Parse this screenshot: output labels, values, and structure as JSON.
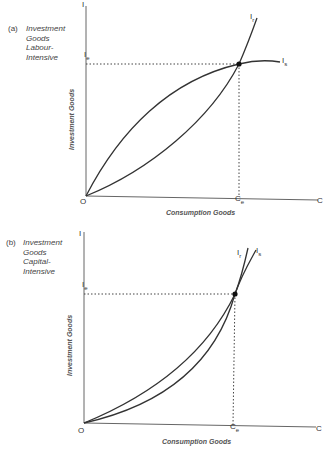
{
  "panels": [
    {
      "id": "a",
      "caption": {
        "tag": "(a)",
        "lines": [
          "Investment",
          "Goods",
          "Labour-",
          "Intensive"
        ]
      },
      "y_axis": {
        "label": "Investment Goods",
        "end_label": "I"
      },
      "x_axis": {
        "label": "Consumption Goods",
        "end_label": "C"
      },
      "origin_label": "O",
      "equilibrium": {
        "i_label": "I",
        "i_sub": "e",
        "c_label": "C",
        "c_sub": "e"
      },
      "curves": [
        {
          "name": "I",
          "sub": "r",
          "shape": "convex (bowed toward C axis), steep beyond equilibrium"
        },
        {
          "name": "I",
          "sub": "s",
          "shape": "concave, flattening beyond equilibrium"
        }
      ]
    },
    {
      "id": "b",
      "caption": {
        "tag": "(b)",
        "lines": [
          "Investment",
          "Goods",
          "Capital-",
          "Intensive"
        ]
      },
      "y_axis": {
        "label": "Investment Goods",
        "end_label": "I"
      },
      "x_axis": {
        "label": "Consumption Goods",
        "end_label": "C"
      },
      "origin_label": "O",
      "equilibrium": {
        "i_label": "I",
        "i_sub": "e",
        "c_label": "C",
        "c_sub": "e"
      },
      "curves": [
        {
          "name": "I",
          "sub": "r",
          "shape": "convex, steeper beyond equilibrium"
        },
        {
          "name": "I",
          "sub": "s",
          "shape": "convex, less steep beyond equilibrium"
        }
      ]
    }
  ],
  "colors": {
    "line": "#333333",
    "text": "#444444"
  }
}
